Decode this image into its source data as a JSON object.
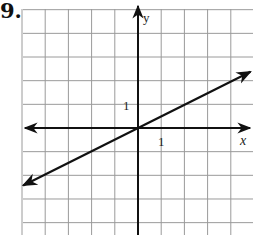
{
  "problem": {
    "number": "9."
  },
  "chart_data": {
    "type": "line",
    "title": "",
    "xlabel": "x",
    "ylabel": "y",
    "tick_labels": {
      "x": "1",
      "y": "1"
    },
    "xlim": [
      -5,
      5
    ],
    "ylim": [
      -4.5,
      5
    ],
    "grid": true,
    "series": [
      {
        "name": "line",
        "x": [
          -5,
          0,
          5
        ],
        "y": [
          -2.5,
          0,
          2.5
        ],
        "slope": 0.5,
        "intercept": 0,
        "arrows": "both"
      }
    ]
  },
  "colors": {
    "grid": "#9a9a9a",
    "axes": "#111111",
    "line": "#111111"
  }
}
